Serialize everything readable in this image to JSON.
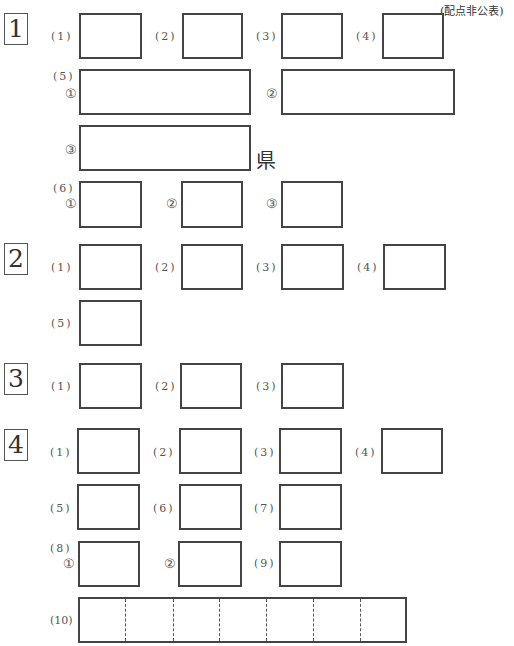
{
  "header": {
    "note": "(配点非公表)"
  },
  "sections": [
    {
      "number": "1",
      "labels": {
        "q1": "(1)",
        "q2": "(2)",
        "q3": "(3)",
        "q4": "(4)",
        "q5": "(5)",
        "q5_1": "①",
        "q5_2": "②",
        "q5_3": "③",
        "q6": "(6)",
        "q6_1": "①",
        "q6_2": "②",
        "q6_3": "③"
      },
      "q5_3_suffix": "県"
    },
    {
      "number": "2",
      "labels": {
        "q1": "(1)",
        "q2": "(2)",
        "q3": "(3)",
        "q4": "(4)",
        "q5": "(5)"
      }
    },
    {
      "number": "3",
      "labels": {
        "q1": "(1)",
        "q2": "(2)",
        "q3": "(3)"
      }
    },
    {
      "number": "4",
      "labels": {
        "q1": "(1)",
        "q2": "(2)",
        "q3": "(3)",
        "q4": "(4)",
        "q5": "(5)",
        "q6": "(6)",
        "q7": "(7)",
        "q8": "(8)",
        "q8_1": "①",
        "q8_2": "②",
        "q9": "(9)",
        "q10": "(10)"
      },
      "q10_cells": 7
    }
  ]
}
